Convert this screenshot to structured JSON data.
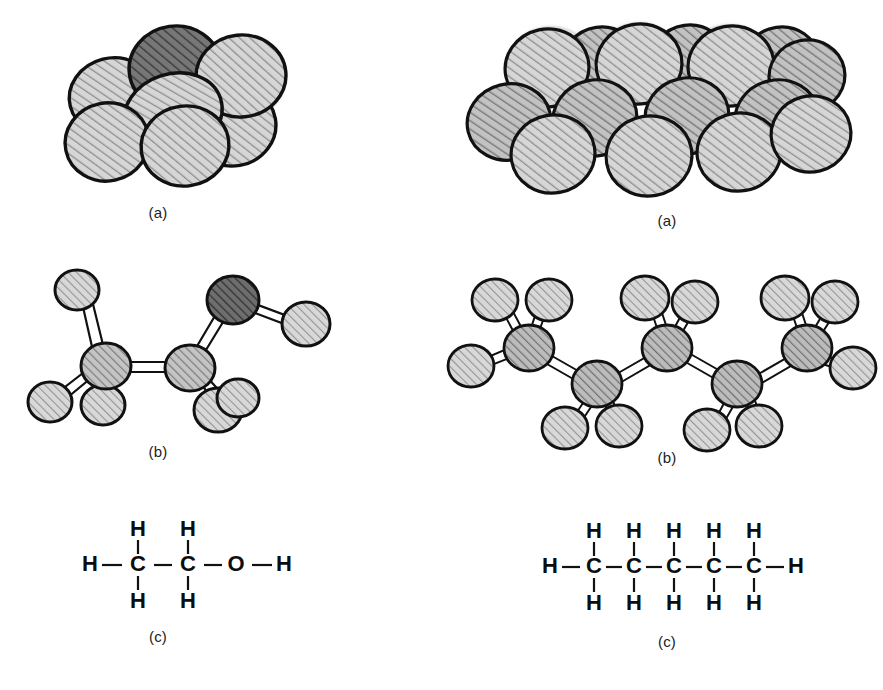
{
  "figure": {
    "background_color": "#ffffff",
    "line_color": "#111111",
    "atom_light_color": "#b8b8b8",
    "atom_dark_color": "#555555",
    "caption_color": "#222222"
  },
  "panels": {
    "left": {
      "molecule_name": "ethanol",
      "space_filling": {
        "caption": "(a)"
      },
      "ball_and_stick": {
        "caption": "(b)"
      },
      "structural": {
        "caption": "(c)",
        "top_labels": [
          "H",
          "H"
        ],
        "chain": [
          "H",
          "C",
          "C",
          "O",
          "H"
        ],
        "bottom_labels": [
          "H",
          "H"
        ]
      }
    },
    "right": {
      "molecule_name": "pentane",
      "space_filling": {
        "caption": "(a)"
      },
      "ball_and_stick": {
        "caption": "(b)"
      },
      "structural": {
        "caption": "(c)",
        "top_labels": [
          "H",
          "H",
          "H",
          "H",
          "H"
        ],
        "chain": [
          "H",
          "C",
          "C",
          "C",
          "C",
          "C",
          "H"
        ],
        "bottom_labels": [
          "H",
          "H",
          "H",
          "H",
          "H"
        ]
      }
    }
  }
}
